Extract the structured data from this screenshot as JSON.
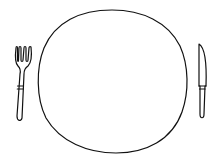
{
  "scene": {
    "description": "Line drawing of a place setting",
    "items": [
      {
        "name": "fork",
        "position": "left"
      },
      {
        "name": "plate",
        "position": "center"
      },
      {
        "name": "knife",
        "position": "right"
      }
    ],
    "stroke_color": "#111111",
    "background": "#ffffff"
  }
}
